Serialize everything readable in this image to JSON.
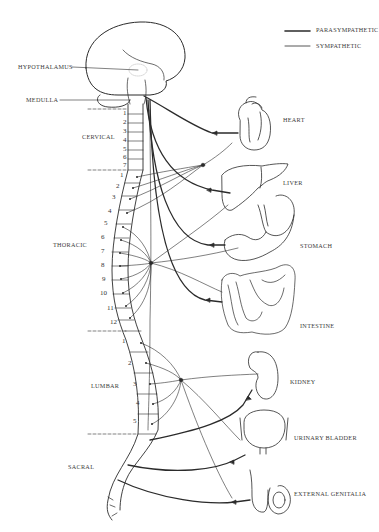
{
  "legend": {
    "items": [
      {
        "label": "PARASYMPATHETIC",
        "line": "thick"
      },
      {
        "label": "SYMPATHETIC",
        "line": "thin"
      }
    ]
  },
  "brain_labels": {
    "hypothalamus": "HYPOTHALAMUS",
    "medulla": "MEDULLA"
  },
  "regions": {
    "cervical": "CERVICAL",
    "thoracic": "THORACIC",
    "lumbar": "LUMBAR",
    "sacral": "SACRAL"
  },
  "vertebrae": {
    "cervical": [
      "1",
      "2",
      "3",
      "4",
      "5",
      "6",
      "7"
    ],
    "thoracic": [
      "1",
      "2",
      "3",
      "4",
      "5",
      "6",
      "7",
      "8",
      "9",
      "10",
      "11",
      "12"
    ],
    "lumbar": [
      "1",
      "2",
      "3",
      "4",
      "5"
    ]
  },
  "organs": {
    "heart": "HEART",
    "liver": "LIVER",
    "stomach": "STOMACH",
    "intestine": "INTESTINE",
    "kidney": "KIDNEY",
    "urinary_bladder": "URINARY BLADDER",
    "external_genitalia": "EXTERNAL GENITALIA"
  },
  "colors": {
    "line": "#2b2b2b",
    "text": "#3a3a3a",
    "background": "#ffffff"
  }
}
